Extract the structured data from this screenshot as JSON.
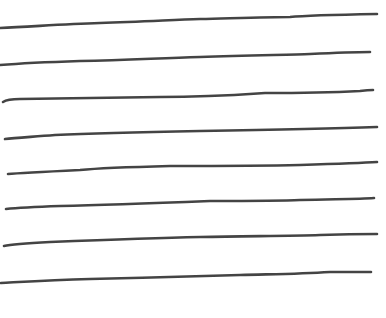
{
  "image": {
    "description": "Eight hand-drawn horizontal ruled lines on white paper",
    "background": "#ffffff",
    "line_color": "#444444",
    "line_width": 2.6
  },
  "lines": [
    {
      "d": "M0,28 C30,27 60,24 100,23 C140,22 170,20 200,19 C240,18 270,17 290,17 C300,16 320,15 377,14"
    },
    {
      "d": "M0,65 C25,63 50,62 80,61 C130,60 160,58 200,57 C250,55 290,55 310,54 C330,53 350,52 370,52"
    },
    {
      "d": "M3,102 C6,100 10,99 20,99 C70,98 120,98 160,97 C210,97 250,94 265,93 C300,93 340,92 360,91 C368,90 372,90 373,90"
    },
    {
      "d": "M5,139 C15,138 30,137 55,135 C100,133 150,132 200,131 C260,130 320,129 377,127"
    },
    {
      "d": "M8,174 C20,173 40,172 80,170 C100,168 130,167 170,166 C230,166 260,166 300,165 C330,164 360,163 377,162"
    },
    {
      "d": "M6,209 C15,208 30,207 60,206 C110,205 160,203 210,201 C250,201 280,201 300,200 C340,199 360,199 374,198"
    },
    {
      "d": "M4,246 C12,244 30,243 50,242 C100,240 150,238 200,237 C250,236 290,236 320,235 C350,234 370,234 377,234"
    },
    {
      "d": "M1,283 C20,282 50,280 90,279 C140,278 200,276 240,275 C280,274 300,274 330,272 C350,272 365,272 371,272"
    }
  ]
}
